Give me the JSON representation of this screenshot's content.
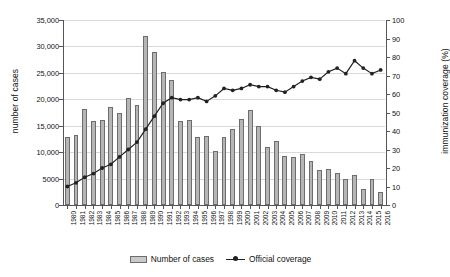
{
  "chart_data": {
    "type": "bar",
    "title": "",
    "subtitle": "",
    "xlabel": "",
    "ylabel": "number of cases",
    "y2label": "immunization coverage (%)",
    "grid": true,
    "legend_position": "bottom",
    "ylim": [
      0,
      35000
    ],
    "y2lim": [
      0,
      100
    ],
    "yticks": [
      "0",
      "5000",
      "10,000",
      "15,000",
      "20,000",
      "25,000",
      "30,000",
      "35,000"
    ],
    "ytick_values": [
      0,
      5000,
      10000,
      15000,
      20000,
      25000,
      30000,
      35000
    ],
    "y2ticks": [
      "0",
      "10",
      "20",
      "30",
      "40",
      "50",
      "60",
      "70",
      "80",
      "90",
      "100"
    ],
    "y2tick_values": [
      0,
      10,
      20,
      30,
      40,
      50,
      60,
      70,
      80,
      90,
      100
    ],
    "categories": [
      "1980",
      "1981",
      "1982",
      "1983",
      "1984",
      "1985",
      "1986",
      "1987",
      "1988",
      "1989",
      "1990",
      "1991",
      "1992",
      "1993",
      "1994",
      "1995",
      "1996",
      "1997",
      "1998",
      "1999",
      "2000",
      "2001",
      "2002",
      "2003",
      "2004",
      "2005",
      "2006",
      "2007",
      "2008",
      "2009",
      "2010",
      "2011",
      "2012",
      "2013",
      "2014",
      "2015",
      "2016"
    ],
    "series": [
      {
        "name": "Number of cases",
        "type": "bar",
        "axis": "left",
        "color": "#b6b6b6",
        "edge_color": "#6d6d6d",
        "values": [
          12800,
          13200,
          18100,
          15900,
          16100,
          18500,
          17500,
          20300,
          19000,
          32000,
          29000,
          25200,
          23700,
          15900,
          16100,
          12800,
          13100,
          10200,
          12900,
          14300,
          16200,
          18000,
          14900,
          11000,
          12100,
          9200,
          9100,
          9600,
          8300,
          6700,
          6800,
          6000,
          5000,
          5600,
          3100,
          4900,
          2500
        ]
      },
      {
        "name": "Official coverage",
        "type": "line",
        "axis": "right",
        "color": "#222222",
        "marker": "circle",
        "values": [
          10,
          12,
          15,
          17,
          20,
          22,
          26,
          30,
          34,
          41,
          48,
          55,
          58,
          57,
          57,
          58,
          56,
          59,
          63,
          62,
          63,
          65,
          64,
          64,
          62,
          61,
          64,
          67,
          69,
          68,
          72,
          74,
          71,
          78,
          74,
          71,
          73
        ]
      }
    ]
  },
  "legend": {
    "items": [
      {
        "label": "Number of cases",
        "marker": "bar-swatch"
      },
      {
        "label": "Official coverage",
        "marker": "line-marker"
      }
    ]
  }
}
